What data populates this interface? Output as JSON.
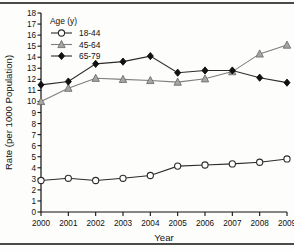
{
  "chart_data": {
    "type": "line",
    "title": "",
    "xlabel": "Year",
    "ylabel": "Rate (per 1000 Population)",
    "categories": [
      "2000",
      "2001",
      "2002",
      "2003",
      "2004",
      "2005",
      "2006",
      "2007",
      "2008",
      "2009"
    ],
    "x": [
      2000,
      2001,
      2002,
      2003,
      2004,
      2005,
      2006,
      2007,
      2008,
      2009
    ],
    "xlim": [
      2000,
      2009
    ],
    "ylim": [
      0,
      18
    ],
    "yticks": [
      0,
      1,
      2,
      3,
      4,
      5,
      6,
      7,
      8,
      9,
      10,
      11,
      12,
      13,
      14,
      15,
      16,
      17,
      18
    ],
    "grid": false,
    "legend_position": "top-left",
    "legend_title": "Age (y)",
    "series": [
      {
        "name": "18-44",
        "marker": "open-circle",
        "color": "#2b2b2b",
        "fill": "#ffffff",
        "values": [
          2.85,
          3.05,
          2.85,
          3.05,
          3.3,
          4.15,
          4.25,
          4.35,
          4.5,
          4.8
        ]
      },
      {
        "name": "45-64",
        "marker": "triangle",
        "color": "#8c8c8c",
        "fill": "#a5a5a5",
        "values": [
          10.0,
          11.2,
          12.1,
          12.0,
          11.9,
          11.75,
          12.05,
          12.7,
          14.3,
          15.1
        ]
      },
      {
        "name": "65-79",
        "marker": "diamond",
        "color": "#111111",
        "fill": "#111111",
        "values": [
          11.5,
          11.8,
          13.4,
          13.6,
          14.1,
          12.6,
          12.8,
          12.8,
          12.15,
          11.7
        ]
      }
    ]
  }
}
